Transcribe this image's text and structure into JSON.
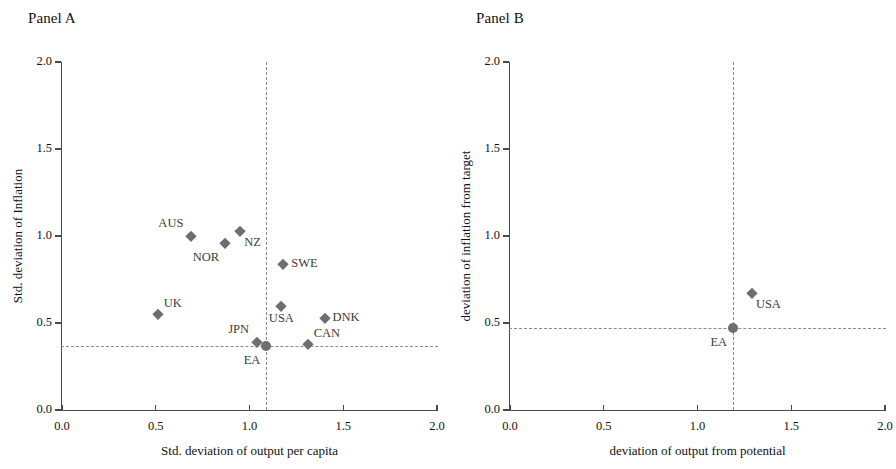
{
  "figure": {
    "width": 896,
    "height": 469,
    "background": "#ffffff",
    "marker_color": "#6e6e6e",
    "refline_color": "#8a8a8a",
    "axis_color": "#4a4a4a"
  },
  "chart_data": [
    {
      "type": "scatter",
      "title": "Panel A",
      "xlabel": "Std. deviation of output per capita",
      "ylabel": "Std. deviation of Inflation",
      "xlim": [
        0.0,
        2.0
      ],
      "ylim": [
        0.0,
        2.0
      ],
      "xticks": [
        "0.0",
        "0.5",
        "1.0",
        "1.5",
        "2.0"
      ],
      "xtick_values": [
        0.0,
        0.5,
        1.0,
        1.5,
        2.0
      ],
      "yticks": [
        "0.0",
        "0.5",
        "1.0",
        "1.5",
        "2.0"
      ],
      "ytick_values": [
        0.0,
        0.5,
        1.0,
        1.5,
        2.0
      ],
      "grid": false,
      "legend": "none",
      "reference_lines": {
        "vertical_x": 1.09,
        "horizontal_y": 0.37,
        "style": "dashed"
      },
      "points": [
        {
          "label": "AUS",
          "x": 0.69,
          "y": 1.0,
          "marker": "diamond",
          "label_pos": "above-left"
        },
        {
          "label": "NOR",
          "x": 0.87,
          "y": 0.96,
          "marker": "diamond",
          "label_pos": "below-left"
        },
        {
          "label": "NZ",
          "x": 0.95,
          "y": 1.03,
          "marker": "diamond",
          "label_pos": "below-right"
        },
        {
          "label": "SWE",
          "x": 1.18,
          "y": 0.84,
          "marker": "diamond",
          "label_pos": "right"
        },
        {
          "label": "UK",
          "x": 0.51,
          "y": 0.55,
          "marker": "diamond",
          "label_pos": "above-right"
        },
        {
          "label": "USA",
          "x": 1.17,
          "y": 0.6,
          "marker": "diamond",
          "label_pos": "below"
        },
        {
          "label": "DNK",
          "x": 1.4,
          "y": 0.53,
          "marker": "diamond",
          "label_pos": "right"
        },
        {
          "label": "JPN",
          "x": 1.04,
          "y": 0.39,
          "marker": "diamond",
          "label_pos": "above-left"
        },
        {
          "label": "CAN",
          "x": 1.31,
          "y": 0.38,
          "marker": "diamond",
          "label_pos": "above-right"
        },
        {
          "label": "EA",
          "x": 1.09,
          "y": 0.37,
          "marker": "circle",
          "label_pos": "below-left"
        }
      ]
    },
    {
      "type": "scatter",
      "title": "Panel B",
      "xlabel": "deviation of output from potential",
      "ylabel": "deviation of inflation from target",
      "xlim": [
        0.0,
        2.0
      ],
      "ylim": [
        0.0,
        2.0
      ],
      "xticks": [
        "0.0",
        "0.5",
        "1.0",
        "1.5",
        "2.0"
      ],
      "xtick_values": [
        0.0,
        0.5,
        1.0,
        1.5,
        2.0
      ],
      "yticks": [
        "0.0",
        "0.5",
        "1.0",
        "1.5",
        "2.0"
      ],
      "ytick_values": [
        0.0,
        0.5,
        1.0,
        1.5,
        2.0
      ],
      "grid": false,
      "legend": "none",
      "reference_lines": {
        "vertical_x": 1.19,
        "horizontal_y": 0.47,
        "style": "dashed"
      },
      "points": [
        {
          "label": "USA",
          "x": 1.29,
          "y": 0.67,
          "marker": "diamond",
          "label_pos": "below-right"
        },
        {
          "label": "EA",
          "x": 1.19,
          "y": 0.47,
          "marker": "circle",
          "label_pos": "below-left"
        }
      ]
    }
  ]
}
